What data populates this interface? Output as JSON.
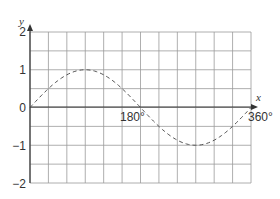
{
  "chart_data": {
    "type": "line",
    "title": "",
    "xlabel": "x",
    "ylabel": "y",
    "xlim": [
      0,
      360
    ],
    "ylim": [
      -2,
      2
    ],
    "grid": true,
    "x_grid_step": 30,
    "y_grid_step": 0.5,
    "x_tick_labels": [
      "180°",
      "360°"
    ],
    "y_tick_labels": [
      "2",
      "1",
      "0",
      "−1",
      "−2"
    ],
    "series": [
      {
        "name": "y = sin x",
        "style": "dashed",
        "x": [
          0,
          30,
          60,
          90,
          120,
          150,
          180,
          210,
          240,
          270,
          300,
          330,
          360
        ],
        "values": [
          0,
          0.5,
          0.87,
          1,
          0.87,
          0.5,
          0,
          -0.5,
          -0.87,
          -1,
          -0.87,
          -0.5,
          0
        ]
      }
    ]
  },
  "labels": {
    "x_axis": "x",
    "y_axis": "y",
    "y2": "2",
    "y1": "1",
    "y0": "0",
    "ym1": "−1",
    "ym2": "−2",
    "x180": "180°",
    "x360": "360°"
  },
  "colors": {
    "grid": "#9a9a9a",
    "axis": "#333333",
    "curve": "#555555"
  }
}
